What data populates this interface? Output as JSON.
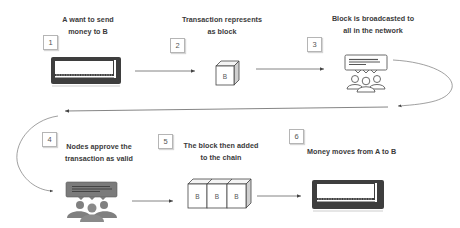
{
  "diagram": {
    "steps": [
      {
        "number": "1",
        "label_line1": "A want to send",
        "label_line2": "money to B",
        "icon": "wallet-icon"
      },
      {
        "number": "2",
        "label_line1": "Transaction represents",
        "label_line2": "as block",
        "icon": "block-cube-icon",
        "block_label": "B"
      },
      {
        "number": "3",
        "label_line1": "Block is broadcasted to",
        "label_line2": "all in the network",
        "icon": "network-users-icon"
      },
      {
        "number": "4",
        "label_line1": "Nodes approve the",
        "label_line2": "transaction as valid",
        "icon": "network-users-filled-icon"
      },
      {
        "number": "5",
        "label_line1": "The block then added",
        "label_line2": "to the chain",
        "icon": "blockchain-icon",
        "block_labels": [
          "B",
          "B",
          "B"
        ]
      },
      {
        "number": "6",
        "label_line1": "Money moves from A to B",
        "label_line2": "",
        "icon": "wallet-icon"
      }
    ],
    "colors": {
      "line": "#555555",
      "icon_dark": "#4a4a4a",
      "icon_gray": "#7a7a7a",
      "box_border": "#b5b5b5",
      "text": "#3a3a3a"
    }
  }
}
